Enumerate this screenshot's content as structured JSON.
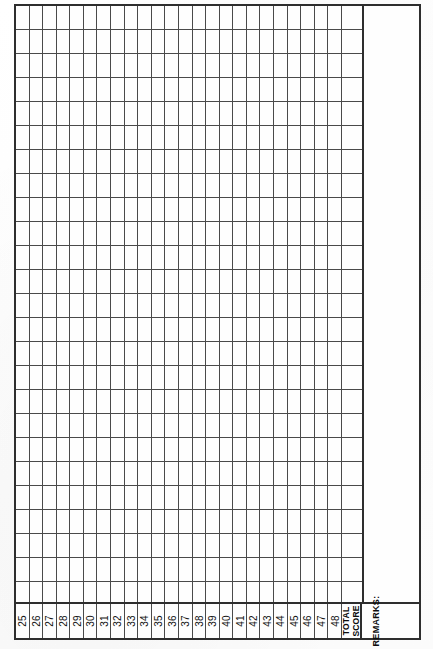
{
  "sheet": {
    "title": "score-tally-grid",
    "columns": [
      {
        "label": "25",
        "kind": "number"
      },
      {
        "label": "26",
        "kind": "number"
      },
      {
        "label": "27",
        "kind": "number"
      },
      {
        "label": "28",
        "kind": "number"
      },
      {
        "label": "29",
        "kind": "number"
      },
      {
        "label": "30",
        "kind": "number"
      },
      {
        "label": "31",
        "kind": "number"
      },
      {
        "label": "32",
        "kind": "number"
      },
      {
        "label": "33",
        "kind": "number"
      },
      {
        "label": "34",
        "kind": "number"
      },
      {
        "label": "35",
        "kind": "number"
      },
      {
        "label": "36",
        "kind": "number"
      },
      {
        "label": "37",
        "kind": "number"
      },
      {
        "label": "38",
        "kind": "number"
      },
      {
        "label": "39",
        "kind": "number"
      },
      {
        "label": "40",
        "kind": "number"
      },
      {
        "label": "41",
        "kind": "number"
      },
      {
        "label": "42",
        "kind": "number"
      },
      {
        "label": "43",
        "kind": "number"
      },
      {
        "label": "44",
        "kind": "number"
      },
      {
        "label": "45",
        "kind": "number"
      },
      {
        "label": "46",
        "kind": "number"
      },
      {
        "label": "47",
        "kind": "number"
      },
      {
        "label": "48",
        "kind": "number"
      }
    ],
    "total_score": {
      "line1": "TOTAL",
      "line2": "SCORE"
    },
    "remarks": {
      "label": "REMARKS:",
      "value": ""
    },
    "row_count": 25,
    "cells": [
      [
        "",
        "",
        "",
        "",
        "",
        "",
        "",
        "",
        "",
        "",
        "",
        "",
        "",
        "",
        "",
        "",
        "",
        "",
        "",
        "",
        "",
        "",
        "",
        "",
        ""
      ],
      [
        "",
        "",
        "",
        "",
        "",
        "",
        "",
        "",
        "",
        "",
        "",
        "",
        "",
        "",
        "",
        "",
        "",
        "",
        "",
        "",
        "",
        "",
        "",
        "",
        ""
      ],
      [
        "",
        "",
        "",
        "",
        "",
        "",
        "",
        "",
        "",
        "",
        "",
        "",
        "",
        "",
        "",
        "",
        "",
        "",
        "",
        "",
        "",
        "",
        "",
        "",
        ""
      ],
      [
        "",
        "",
        "",
        "",
        "",
        "",
        "",
        "",
        "",
        "",
        "",
        "",
        "",
        "",
        "",
        "",
        "",
        "",
        "",
        "",
        "",
        "",
        "",
        "",
        ""
      ],
      [
        "",
        "",
        "",
        "",
        "",
        "",
        "",
        "",
        "",
        "",
        "",
        "",
        "",
        "",
        "",
        "",
        "",
        "",
        "",
        "",
        "",
        "",
        "",
        "",
        ""
      ],
      [
        "",
        "",
        "",
        "",
        "",
        "",
        "",
        "",
        "",
        "",
        "",
        "",
        "",
        "",
        "",
        "",
        "",
        "",
        "",
        "",
        "",
        "",
        "",
        "",
        ""
      ],
      [
        "",
        "",
        "",
        "",
        "",
        "",
        "",
        "",
        "",
        "",
        "",
        "",
        "",
        "",
        "",
        "",
        "",
        "",
        "",
        "",
        "",
        "",
        "",
        "",
        ""
      ],
      [
        "",
        "",
        "",
        "",
        "",
        "",
        "",
        "",
        "",
        "",
        "",
        "",
        "",
        "",
        "",
        "",
        "",
        "",
        "",
        "",
        "",
        "",
        "",
        "",
        ""
      ],
      [
        "",
        "",
        "",
        "",
        "",
        "",
        "",
        "",
        "",
        "",
        "",
        "",
        "",
        "",
        "",
        "",
        "",
        "",
        "",
        "",
        "",
        "",
        "",
        "",
        ""
      ],
      [
        "",
        "",
        "",
        "",
        "",
        "",
        "",
        "",
        "",
        "",
        "",
        "",
        "",
        "",
        "",
        "",
        "",
        "",
        "",
        "",
        "",
        "",
        "",
        "",
        ""
      ],
      [
        "",
        "",
        "",
        "",
        "",
        "",
        "",
        "",
        "",
        "",
        "",
        "",
        "",
        "",
        "",
        "",
        "",
        "",
        "",
        "",
        "",
        "",
        "",
        "",
        ""
      ],
      [
        "",
        "",
        "",
        "",
        "",
        "",
        "",
        "",
        "",
        "",
        "",
        "",
        "",
        "",
        "",
        "",
        "",
        "",
        "",
        "",
        "",
        "",
        "",
        "",
        ""
      ],
      [
        "",
        "",
        "",
        "",
        "",
        "",
        "",
        "",
        "",
        "",
        "",
        "",
        "",
        "",
        "",
        "",
        "",
        "",
        "",
        "",
        "",
        "",
        "",
        "",
        ""
      ],
      [
        "",
        "",
        "",
        "",
        "",
        "",
        "",
        "",
        "",
        "",
        "",
        "",
        "",
        "",
        "",
        "",
        "",
        "",
        "",
        "",
        "",
        "",
        "",
        "",
        ""
      ],
      [
        "",
        "",
        "",
        "",
        "",
        "",
        "",
        "",
        "",
        "",
        "",
        "",
        "",
        "",
        "",
        "",
        "",
        "",
        "",
        "",
        "",
        "",
        "",
        "",
        ""
      ],
      [
        "",
        "",
        "",
        "",
        "",
        "",
        "",
        "",
        "",
        "",
        "",
        "",
        "",
        "",
        "",
        "",
        "",
        "",
        "",
        "",
        "",
        "",
        "",
        "",
        ""
      ],
      [
        "",
        "",
        "",
        "",
        "",
        "",
        "",
        "",
        "",
        "",
        "",
        "",
        "",
        "",
        "",
        "",
        "",
        "",
        "",
        "",
        "",
        "",
        "",
        "",
        ""
      ],
      [
        "",
        "",
        "",
        "",
        "",
        "",
        "",
        "",
        "",
        "",
        "",
        "",
        "",
        "",
        "",
        "",
        "",
        "",
        "",
        "",
        "",
        "",
        "",
        "",
        ""
      ],
      [
        "",
        "",
        "",
        "",
        "",
        "",
        "",
        "",
        "",
        "",
        "",
        "",
        "",
        "",
        "",
        "",
        "",
        "",
        "",
        "",
        "",
        "",
        "",
        "",
        ""
      ],
      [
        "",
        "",
        "",
        "",
        "",
        "",
        "",
        "",
        "",
        "",
        "",
        "",
        "",
        "",
        "",
        "",
        "",
        "",
        "",
        "",
        "",
        "",
        "",
        "",
        ""
      ],
      [
        "",
        "",
        "",
        "",
        "",
        "",
        "",
        "",
        "",
        "",
        "",
        "",
        "",
        "",
        "",
        "",
        "",
        "",
        "",
        "",
        "",
        "",
        "",
        "",
        ""
      ],
      [
        "",
        "",
        "",
        "",
        "",
        "",
        "",
        "",
        "",
        "",
        "",
        "",
        "",
        "",
        "",
        "",
        "",
        "",
        "",
        "",
        "",
        "",
        "",
        "",
        ""
      ],
      [
        "",
        "",
        "",
        "",
        "",
        "",
        "",
        "",
        "",
        "",
        "",
        "",
        "",
        "",
        "",
        "",
        "",
        "",
        "",
        "",
        "",
        "",
        "",
        "",
        ""
      ],
      [
        "",
        "",
        "",
        "",
        "",
        "",
        "",
        "",
        "",
        "",
        "",
        "",
        "",
        "",
        "",
        "",
        "",
        "",
        "",
        "",
        "",
        "",
        "",
        "",
        ""
      ],
      [
        "",
        "",
        "",
        "",
        "",
        "",
        "",
        "",
        "",
        "",
        "",
        "",
        "",
        "",
        "",
        "",
        "",
        "",
        "",
        "",
        "",
        "",
        "",
        "",
        ""
      ]
    ],
    "colors": {
      "frame": "#2e2e2e",
      "rule": "#4a4a4a",
      "paper": "#fefefe",
      "ink": "#111111"
    }
  }
}
